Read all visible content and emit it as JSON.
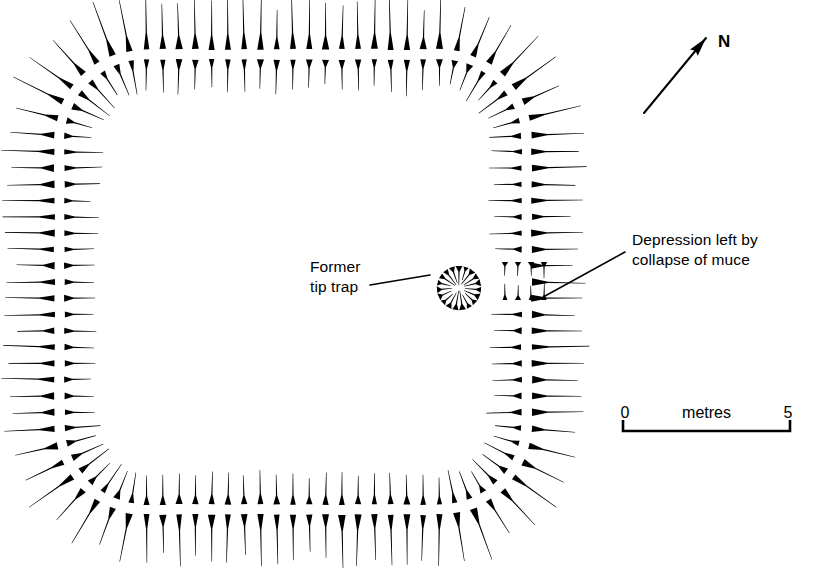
{
  "figure": {
    "type": "archaeological-earthwork-plan",
    "background_color": "#ffffff",
    "ink_color": "#000000",
    "symbol_style": "hachure"
  },
  "annotations": [
    {
      "id": "former-tip-trap",
      "line1": "Former",
      "line2": "tip trap",
      "text_x": 310,
      "text_y": 272,
      "align": "start",
      "leader": {
        "x1": 370,
        "y1": 285,
        "x2": 430,
        "y2": 275
      }
    },
    {
      "id": "depression-collapse",
      "line1": "Depression left by",
      "line2": "collapse of muce",
      "text_x": 632,
      "text_y": 245,
      "align": "start",
      "leader": {
        "x1": 625,
        "y1": 252,
        "x2": 545,
        "y2": 296
      }
    }
  ],
  "north_arrow": {
    "label": "N",
    "label_x": 718,
    "label_y": 47,
    "shaft": {
      "x1": 644,
      "y1": 113,
      "x2": 706,
      "y2": 38
    },
    "head_angle_deg": -50.4
  },
  "scale_bar": {
    "left_label": "0",
    "center_label": "metres",
    "right_label": "5",
    "x_start": 623,
    "x_end": 790,
    "y_baseline": 431,
    "tick_height": 11,
    "label_y": 418,
    "units": "metres",
    "min_value": 0,
    "max_value": 5
  },
  "chart_data": {
    "type": "map",
    "title": "",
    "features": [
      {
        "name": "enclosure-bank",
        "shape": "rounded-square",
        "center_x": 293,
        "center_y": 282,
        "half_width": 233,
        "half_height": 227,
        "corner_radius": 86,
        "row_count": 2,
        "hachure_count_outer": 104,
        "hachure_count_inner": 104,
        "outer_length": 46,
        "inner_length": 30,
        "gap_start_deg": 27,
        "gap_end_deg": 52
      },
      {
        "name": "former-tip-trap-hollow",
        "shape": "circle",
        "center_x": 459,
        "center_y": 288,
        "radius": 22,
        "hachure_count": 19,
        "hachure_length": 16,
        "direction": "inward"
      },
      {
        "name": "collapse-depression",
        "shape": "hachure-pair-grid",
        "columns": 4,
        "rows": 2,
        "x_start": 505,
        "x_step": 13,
        "top_y": 262,
        "bottom_y": 300,
        "hachure_length": 15
      }
    ],
    "legend": [],
    "grid": false
  }
}
